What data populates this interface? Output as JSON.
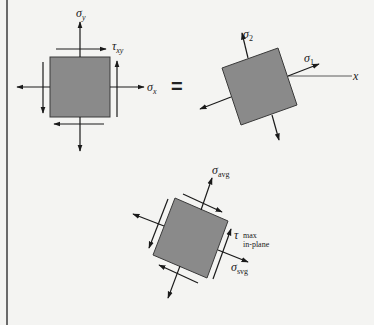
{
  "figure": {
    "left_element": {
      "sigma_y": {
        "sym": "σ",
        "sub": "y"
      },
      "sigma_x": {
        "sym": "σ",
        "sub": "x"
      },
      "tau_xy": {
        "sym": "τ",
        "sub": "xy"
      }
    },
    "equals": "=",
    "principal_element": {
      "sigma_1": {
        "sym": "σ",
        "sub": "1"
      },
      "sigma_2": {
        "sym": "σ",
        "sub": "2"
      },
      "axis_x": "x"
    },
    "max_shear_element": {
      "sigma_avg_top": {
        "sym": "σ",
        "sub": "avg"
      },
      "sigma_avg_bottom": {
        "sym": "σ",
        "sub": "svg"
      },
      "tau_max": {
        "sym": "τ",
        "sub": "max",
        "sub2": "in-plane"
      }
    },
    "colors": {
      "element_fill": "#8a8a8a",
      "element_stroke": "#3a3a3a",
      "arrow": "#1a1a1a",
      "background": "#f4f4f2"
    }
  }
}
